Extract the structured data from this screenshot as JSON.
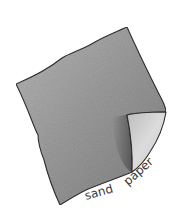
{
  "illustration": {
    "subject": "sandpaper sheet with curled corner",
    "caption_word_1": "sand",
    "caption_word_2": "paper"
  },
  "colors": {
    "background": "#ffffff",
    "sheet_light": "#b4b4b4",
    "sheet_mid": "#9a9a9a",
    "sheet_dark": "#6e6e6e",
    "curl_light": "#d8d8d8",
    "outline": "#2e2e2e",
    "text": "#3a3a3a"
  }
}
